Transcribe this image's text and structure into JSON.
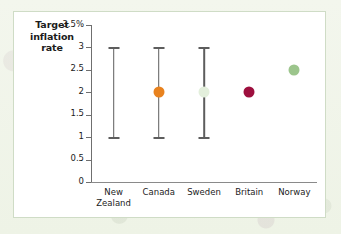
{
  "chart_data": {
    "type": "scatter",
    "title": "Target inflation rate",
    "xlabel": "",
    "ylabel": "Target inflation rate",
    "ylim": [
      0,
      3.5
    ],
    "grid": false,
    "legend": "none",
    "y_tick_labels": [
      "3.5%",
      "3",
      "2.5",
      "2",
      "1.5",
      "1",
      "0.5",
      "0"
    ],
    "y_tick_values": [
      3.5,
      3,
      2.5,
      2,
      1.5,
      1,
      0.5,
      0
    ],
    "categories": [
      "New\nZealand",
      "Canada",
      "Sweden",
      "Britain",
      "Norway"
    ],
    "points": [
      {
        "category": "New\nZealand",
        "target": null,
        "range_low": 1,
        "range_high": 3,
        "color": "#5d5d5d"
      },
      {
        "category": "Canada",
        "target": 2,
        "range_low": 1,
        "range_high": 3,
        "color": "#e8821e"
      },
      {
        "category": "Sweden",
        "target": 2,
        "range_low": 1,
        "range_high": 3,
        "color": "#e3efdc"
      },
      {
        "category": "Britain",
        "target": 2,
        "range_low": null,
        "range_high": null,
        "color": "#9d0f3e"
      },
      {
        "category": "Norway",
        "target": 2.5,
        "range_low": null,
        "range_high": null,
        "color": "#9cc58c"
      }
    ]
  },
  "colors": {
    "panel_background": "#ffffff",
    "panel_border": "#cfdcc6",
    "page_background": "#f2f5ec",
    "axis": "#6f6f6f",
    "range_bar": "#5d5d5d",
    "canada": "#e8821e",
    "sweden": "#e3efdc",
    "britain": "#9d0f3e",
    "norway": "#9cc58c"
  }
}
